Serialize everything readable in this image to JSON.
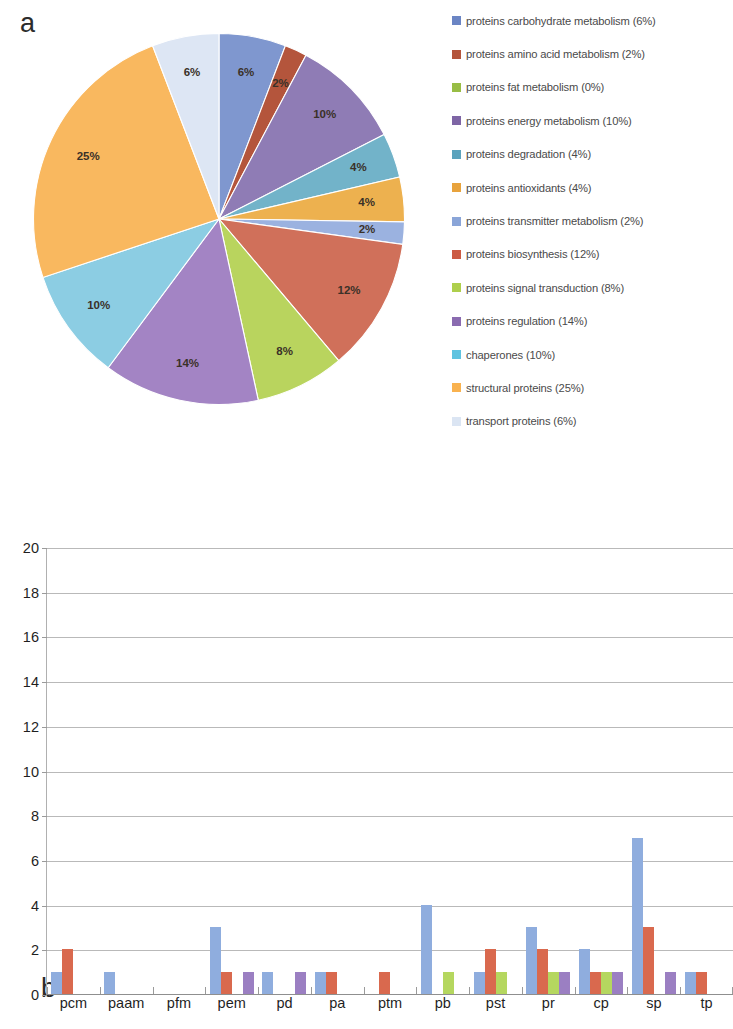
{
  "figure": {
    "panel_a_letter": "a",
    "panel_b_letter": "b"
  },
  "legend": {
    "items": [
      {
        "label": "proteins carbohydrate metabolism (6%)",
        "color": "#6b85c4"
      },
      {
        "label": "proteins amino acid metabolism (2%)",
        "color": "#b4553c"
      },
      {
        "label": "proteins fat metabolism (0%)",
        "color": "#98bd45"
      },
      {
        "label": "proteins energy metabolism (10%)",
        "color": "#7e65a5"
      },
      {
        "label": "proteins degradation (4%)",
        "color": "#5ba3bd"
      },
      {
        "label": "proteins antioxidants (4%)",
        "color": "#e8a33d"
      },
      {
        "label": "proteins transmitter metabolism (2%)",
        "color": "#8aa5d8"
      },
      {
        "label": "proteins biosynthesis (12%)",
        "color": "#cc5b44"
      },
      {
        "label": "proteins signal transduction (8%)",
        "color": "#aecf4c"
      },
      {
        "label": "proteins regulation (14%)",
        "color": "#8a6bb0"
      },
      {
        "label": "chaperones (10%)",
        "color": "#5fc3e0"
      },
      {
        "label": "structural proteins (25%)",
        "color": "#f9b24f"
      },
      {
        "label": "transport proteins (6%)",
        "color": "#dbe5f3"
      }
    ]
  },
  "chart_data": [
    {
      "id": "panel-a-pie",
      "type": "pie",
      "title": "",
      "legend_position": "right",
      "start_angle_deg": 0,
      "direction": "clockwise",
      "labels": [
        "proteins carbohydrate metabolism",
        "proteins amino acid metabolism",
        "proteins fat metabolism",
        "proteins energy metabolism",
        "proteins degradation",
        "proteins antioxidants",
        "proteins transmitter metabolism",
        "proteins biosynthesis",
        "proteins signal transduction",
        "proteins regulation",
        "chaperones",
        "structural proteins",
        "transport proteins"
      ],
      "values": [
        6,
        2,
        0,
        10,
        4,
        4,
        2,
        12,
        8,
        14,
        10,
        25,
        6
      ],
      "data_labels": [
        "6%",
        "2%",
        "",
        "10%",
        "4%",
        "4%",
        "2%",
        "12%",
        "8%",
        "14%",
        "10%",
        "25%",
        "6%"
      ],
      "colors": [
        "#7f97cf",
        "#b4553c",
        "#98bd45",
        "#8f7cb5",
        "#72b3c9",
        "#edb14f",
        "#9bb2e0",
        "#d0705a",
        "#b9d45e",
        "#a384c4",
        "#8ccde3",
        "#f9b85f",
        "#dde6f4"
      ],
      "units": "percent"
    },
    {
      "id": "panel-b-bar",
      "type": "bar",
      "title": "",
      "xlabel": "",
      "ylabel": "",
      "ylim": [
        0,
        20
      ],
      "yticks": [
        0,
        2,
        4,
        6,
        8,
        10,
        12,
        14,
        16,
        18,
        20
      ],
      "grid": true,
      "grouped": true,
      "categories": [
        "pcm",
        "paam",
        "pfm",
        "pem",
        "pd",
        "pa",
        "ptm",
        "pb",
        "pst",
        "pr",
        "cp",
        "sp",
        "tp"
      ],
      "series": [
        {
          "name": "series-1",
          "color": "#8fadde",
          "values": [
            1,
            1,
            0,
            3,
            1,
            1,
            0,
            4,
            1,
            3,
            2,
            7,
            1
          ]
        },
        {
          "name": "series-2",
          "color": "#d9694e",
          "values": [
            2,
            0,
            0,
            1,
            0,
            1,
            1,
            0,
            2,
            2,
            1,
            3,
            1
          ]
        },
        {
          "name": "series-3",
          "color": "#b5d75f",
          "values": [
            0,
            0,
            0,
            0,
            0,
            0,
            0,
            1,
            1,
            1,
            1,
            0,
            0
          ]
        },
        {
          "name": "series-4",
          "color": "#9b7fc2",
          "values": [
            0,
            0,
            0,
            1,
            1,
            0,
            0,
            0,
            0,
            1,
            1,
            1,
            0
          ]
        }
      ]
    }
  ]
}
